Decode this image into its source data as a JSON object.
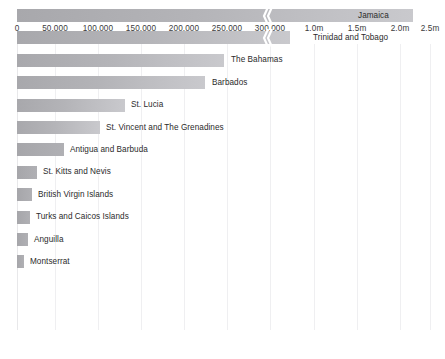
{
  "chart": {
    "type": "bar",
    "orientation": "horizontal",
    "title": "",
    "subtitle": "",
    "xlabel": "",
    "ylabel": "",
    "grid": true,
    "legend": false,
    "axis_break": true,
    "axis_break_note": "scale break between 300,000 and 1.0m",
    "colors": {
      "bar_start": "#a8a8ac",
      "bar_end": "#c9c9cd",
      "gridline": "#efeff1",
      "label_text": "#2b2b2b",
      "tick_text": "#3b3b3b",
      "background": "#ffffff"
    }
  },
  "chart_data": {
    "type": "bar",
    "title": "",
    "xlabel": "",
    "ylabel": "",
    "grid": true,
    "legend": false,
    "orientation": "horizontal",
    "axis": {
      "break": true,
      "segment_1_range": [
        0,
        300000
      ],
      "segment_2_range": [
        1000000,
        2500000
      ],
      "tick_labels": [
        "0",
        "50,000",
        "100,000",
        "150,000",
        "200,000",
        "250,000",
        "300,000",
        "1.0m",
        "1.5m",
        "2.0m",
        "2.5m"
      ],
      "tick_values": [
        0,
        50000,
        100000,
        150000,
        200000,
        250000,
        300000,
        1000000,
        1500000,
        2000000,
        2500000
      ]
    },
    "categories": [
      "Jamaica",
      "Trinidad and Tobago",
      "The Bahamas",
      "Barbados",
      "St. Lucia",
      "St. Vincent and The Grenadines",
      "Antigua and Barbuda",
      "St. Kitts and Nevis",
      "British Virgin Islands",
      "Turks and Caicos Islands",
      "Anguilla",
      "Montserrat"
    ],
    "values": [
      2500000,
      1350000,
      240000,
      217000,
      128000,
      96000,
      55000,
      24000,
      18500,
      16000,
      13000,
      7000
    ]
  },
  "ticks": [
    {
      "label": "0",
      "x": 17
    },
    {
      "label": "50,000",
      "x": 55
    },
    {
      "label": "100,000",
      "x": 98
    },
    {
      "label": "150,000",
      "x": 141
    },
    {
      "label": "200,000",
      "x": 184
    },
    {
      "label": "250,000",
      "x": 227
    },
    {
      "label": "300,000",
      "x": 270
    },
    {
      "label": "1.0m",
      "x": 314
    },
    {
      "label": "1.5m",
      "x": 357
    },
    {
      "label": "2.0m",
      "x": 400
    },
    {
      "label": "2.5m",
      "x": 430
    }
  ],
  "gridlines": [
    17,
    55,
    98,
    141,
    184,
    227,
    270,
    314,
    357,
    400,
    430
  ],
  "bars": [
    {
      "label": "Jamaica",
      "end": 413,
      "labelX": 358,
      "break": true,
      "breakX": 262
    },
    {
      "label": "Trinidad and Tobago",
      "end": 290,
      "labelX": 313,
      "break": true,
      "breakX": 262
    },
    {
      "label": "The Bahamas",
      "end": 224,
      "labelX": 231,
      "break": false,
      "breakX": 0
    },
    {
      "label": "Barbados",
      "end": 205,
      "labelX": 212,
      "break": false,
      "breakX": 0
    },
    {
      "label": "St. Lucia",
      "end": 125,
      "labelX": 131,
      "break": false,
      "breakX": 0
    },
    {
      "label": "St. Vincent and The Grenadines",
      "end": 100,
      "labelX": 106,
      "break": false,
      "breakX": 0
    },
    {
      "label": "Antigua and Barbuda",
      "end": 64,
      "labelX": 70,
      "break": false,
      "breakX": 0
    },
    {
      "label": "St. Kitts and Nevis",
      "end": 37,
      "labelX": 43,
      "break": false,
      "breakX": 0
    },
    {
      "label": "British Virgin Islands",
      "end": 32,
      "labelX": 38,
      "break": false,
      "breakX": 0
    },
    {
      "label": "Turks and Caicos Islands",
      "end": 30,
      "labelX": 36,
      "break": false,
      "breakX": 0
    },
    {
      "label": "Anguilla",
      "end": 28,
      "labelX": 34,
      "break": false,
      "breakX": 0
    },
    {
      "label": "Montserrat",
      "end": 24,
      "labelX": 30,
      "break": false,
      "breakX": 0
    }
  ]
}
